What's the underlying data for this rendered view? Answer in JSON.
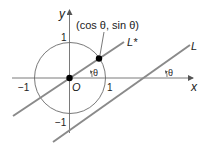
{
  "diagram": {
    "type": "unit-circle-line-normal-angle",
    "colors": {
      "axis": "#7a7a7a",
      "circle": "#6a6a6a",
      "line": "#8a8a8a",
      "point": "#000000",
      "text": "#222222"
    },
    "labels": {
      "y_axis": "y",
      "x_axis": "x",
      "origin": "O",
      "point": "(cos θ, sin θ)",
      "line_star": "L*",
      "line": "L",
      "tick_y_pos": "1",
      "tick_y_neg": "−1",
      "tick_x_pos": "1",
      "tick_x_neg": "−1",
      "angle_inner": "θ",
      "angle_outer": "θ"
    }
  }
}
